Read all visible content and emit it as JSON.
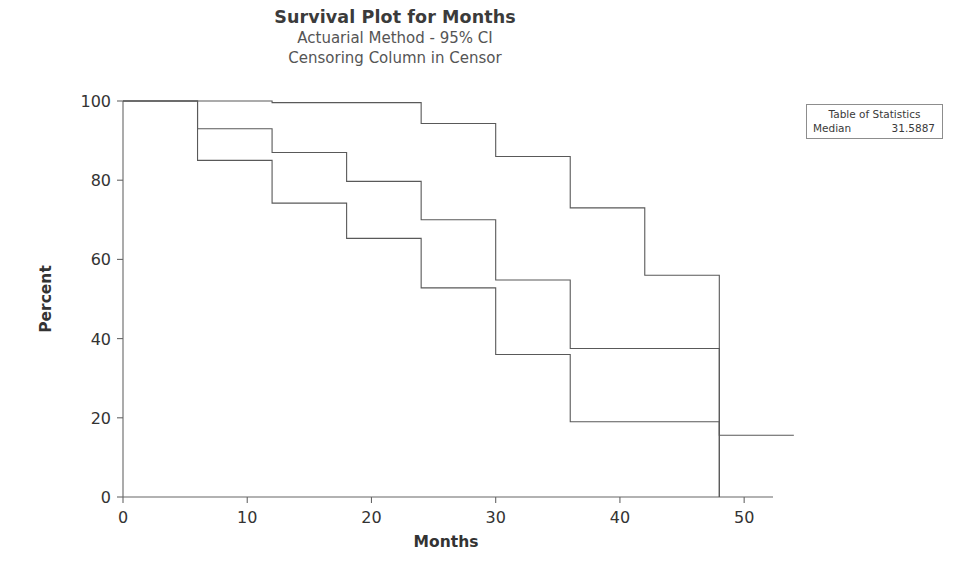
{
  "titles": {
    "main": "Survival Plot for Months",
    "sub1": "Actuarial Method - 95% CI",
    "sub2": "Censoring Column in Censor"
  },
  "axes": {
    "x_title": "Months",
    "y_title": "Percent",
    "x_ticks": [
      "0",
      "10",
      "20",
      "30",
      "40",
      "50"
    ],
    "y_ticks": [
      "0",
      "20",
      "40",
      "60",
      "80",
      "100"
    ]
  },
  "stats_table": {
    "title": "Table of Statistics",
    "rows": [
      {
        "label": "Median",
        "value": "31.5887"
      }
    ]
  },
  "colors": {
    "line": "#595959",
    "axis": "#666666",
    "text": "#333333",
    "background": "#ffffff",
    "box_border": "#8d8d8d"
  },
  "chart_data": {
    "type": "line",
    "subtype": "step-survival",
    "title": "Survival Plot for Months",
    "subtitle": "Actuarial Method - 95% CI; Censoring Column in Censor",
    "xlabel": "Months",
    "ylabel": "Percent",
    "xlim": [
      0,
      52
    ],
    "ylim": [
      0,
      100
    ],
    "xticks": [
      0,
      10,
      20,
      30,
      40,
      50
    ],
    "yticks": [
      0,
      20,
      40,
      60,
      80,
      100
    ],
    "grid": false,
    "legend": "none",
    "step_mode": "post",
    "x": [
      0,
      6,
      12,
      18,
      24,
      30,
      36,
      42,
      48
    ],
    "series": [
      {
        "name": "Upper 95% CI",
        "values": [
          100,
          100,
          99.6,
          99.6,
          94.3,
          86.0,
          73.0,
          56.0,
          15.6
        ]
      },
      {
        "name": "Survival estimate",
        "values": [
          100,
          93.0,
          87.0,
          79.7,
          70.0,
          54.8,
          37.5,
          37.5,
          0
        ]
      },
      {
        "name": "Lower 95% CI",
        "values": [
          100,
          85.0,
          74.2,
          65.3,
          52.8,
          36.0,
          19.0,
          19.0,
          0
        ]
      }
    ],
    "annotations": [
      {
        "text": "Median",
        "value": 31.5887
      }
    ]
  }
}
